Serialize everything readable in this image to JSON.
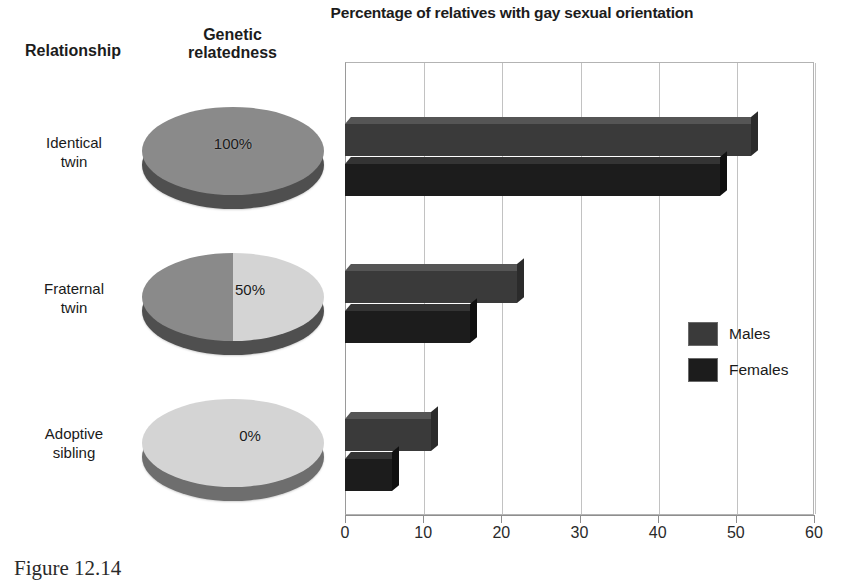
{
  "chart_data": {
    "type": "bar",
    "orientation": "horizontal",
    "title": "Percentage of relatives with gay sexual orientation",
    "xlabel": "",
    "ylabel": "",
    "xlim": [
      0,
      60
    ],
    "xticks": [
      0,
      10,
      20,
      30,
      40,
      50,
      60
    ],
    "xtick_labels": [
      "0",
      "10",
      "20",
      "30",
      "40",
      "50",
      "60"
    ],
    "grid": true,
    "legend_position": "right",
    "categories": [
      "Identical twin",
      "Fraternal twin",
      "Adoptive sibling"
    ],
    "series": [
      {
        "name": "Males",
        "color": "#3a3a3a",
        "values": [
          52,
          22,
          11
        ]
      },
      {
        "name": "Females",
        "color": "#1c1c1c",
        "values": [
          48,
          16,
          6
        ]
      }
    ]
  },
  "headers": {
    "relationship": "Relationship",
    "genetic_line1": "Genetic",
    "genetic_line2": "relatedness"
  },
  "rows": [
    {
      "label_line1": "Identical",
      "label_line2": "twin",
      "pct_label": "100%",
      "males": 52,
      "females": 48
    },
    {
      "label_line1": "Fraternal",
      "label_line2": "twin",
      "pct_label": "50%",
      "males": 22,
      "females": 16
    },
    {
      "label_line1": "Adoptive",
      "label_line2": "sibling",
      "pct_label": "0%",
      "males": 11,
      "females": 6
    }
  ],
  "legend": {
    "males": "Males",
    "females": "Females"
  },
  "axis": {
    "ticks": [
      "0",
      "10",
      "20",
      "30",
      "40",
      "50",
      "60"
    ]
  },
  "caption": "Figure 12.14",
  "colors": {
    "males_bar": "#3a3a3a",
    "females_bar": "#1c1c1c",
    "pie_shaded": "#8a8a8a",
    "pie_unshaded": "#d4d4d4",
    "pie_side_dark": "#4f4f4f",
    "gridline": "#c2c2c2"
  }
}
